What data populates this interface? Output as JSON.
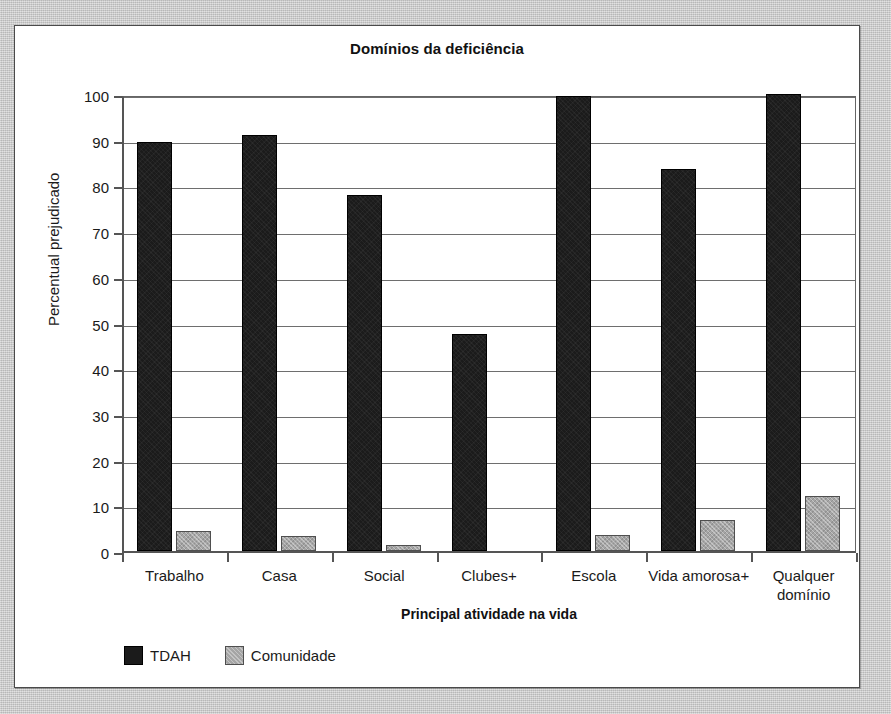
{
  "chart_data": {
    "type": "bar",
    "title": "Domínios da deficiência",
    "xlabel": "Principal atividade na vida",
    "ylabel": "Percentual prejudicado",
    "ylim": [
      0,
      100
    ],
    "yticks": [
      0,
      10,
      20,
      30,
      40,
      50,
      60,
      70,
      80,
      90,
      100
    ],
    "grid": true,
    "legend_position": "bottom-left",
    "categories": [
      "Trabalho",
      "Casa",
      "Social",
      "Clubes+",
      "Escola",
      "Vida amorosa+",
      "Qualquer domínio"
    ],
    "series": [
      {
        "name": "TDAH",
        "color": "#1b1b1b",
        "values": [
          89.5,
          91,
          78,
          47.5,
          99.5,
          83.5,
          100
        ]
      },
      {
        "name": "Comunidade",
        "color": "#a5a5a5",
        "values": [
          4.3,
          3.2,
          1.3,
          0,
          3.6,
          6.8,
          12
        ]
      }
    ]
  }
}
